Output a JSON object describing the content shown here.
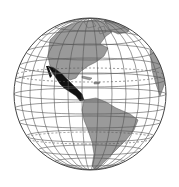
{
  "map": {
    "title": "Globe highlighting Mexico and Central America",
    "projection": "orthographic",
    "center_view": "Western Hemisphere (Americas)",
    "highlighted_region": "Mexico and Central America",
    "colors": {
      "ocean": "#ffffff",
      "land": "#9a9a9a",
      "highlight": "#111111",
      "graticule": "#555555",
      "outline": "#444444"
    },
    "visible_landmasses": [
      "North America",
      "Central America",
      "South America",
      "Caribbean islands",
      "Greenland",
      "West Africa edge"
    ]
  }
}
